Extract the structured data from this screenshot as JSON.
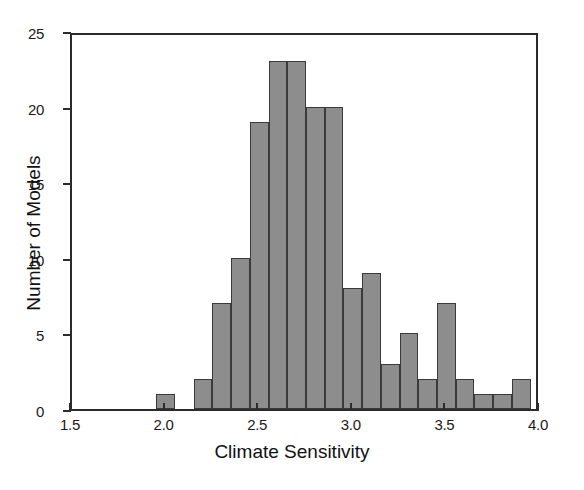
{
  "chart_data": {
    "type": "bar",
    "title": "",
    "subtitle": "",
    "xlabel": "Climate Sensitivity",
    "ylabel": "Number of Models",
    "xlim": [
      1.5,
      4.0
    ],
    "ylim": [
      0,
      25
    ],
    "xticks": [
      "1.5",
      "2.0",
      "2.5",
      "3.0",
      "3.5",
      "4.0"
    ],
    "xtick_values": [
      1.5,
      2.0,
      2.5,
      3.0,
      3.5,
      4.0
    ],
    "yticks": [
      "0",
      "5",
      "10",
      "15",
      "20",
      "25"
    ],
    "ytick_values": [
      0,
      5,
      10,
      15,
      20,
      25
    ],
    "grid": false,
    "legend": "none",
    "bin_width": 0.1,
    "bar_color": "#8d8d8d",
    "bar_edge_color": "#3a3a3a",
    "frame_color": "#2b2b2b",
    "background": "#ffffff",
    "categories": [
      "1.95-2.05",
      "2.15-2.25",
      "2.25-2.35",
      "2.35-2.45",
      "2.45-2.55",
      "2.55-2.65",
      "2.65-2.75",
      "2.75-2.85",
      "2.85-2.95",
      "2.95-3.05",
      "3.05-3.15",
      "3.15-3.25",
      "3.25-3.35",
      "3.35-3.45",
      "3.45-3.55",
      "3.55-3.65",
      "3.65-3.75",
      "3.75-3.85",
      "3.85-3.95"
    ],
    "bin_starts": [
      1.95,
      2.15,
      2.25,
      2.35,
      2.45,
      2.55,
      2.65,
      2.75,
      2.85,
      2.95,
      3.05,
      3.15,
      3.25,
      3.35,
      3.45,
      3.55,
      3.65,
      3.75,
      3.85
    ],
    "values": [
      1,
      2,
      7,
      10,
      19,
      23,
      23,
      20,
      20,
      8,
      9,
      3,
      5,
      2,
      7,
      2,
      1,
      1,
      2
    ]
  }
}
